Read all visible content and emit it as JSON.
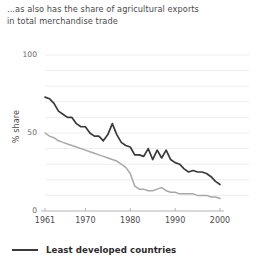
{
  "title": {
    "line1": "...as also has the share of agricultural exports",
    "line2": "in total merchandise trade"
  },
  "legend": {
    "entries": [
      {
        "label": "Least developed countries",
        "color": "#3a3a3a"
      }
    ]
  },
  "colors": {
    "series_dark": "#3a3a3a",
    "series_grey": "#a8a8a8",
    "axis": "#b4b4b4",
    "gridline": "#ededed",
    "text": "#4a4a4a"
  },
  "chart_data": {
    "type": "line",
    "title": "...as also has the share of agricultural exports in total merchandise trade",
    "xlabel": "",
    "ylabel": "% share",
    "xlim": [
      1961,
      2000
    ],
    "ylim": [
      0,
      100
    ],
    "grid": true,
    "legend_position": "bottom-left",
    "xticks": [
      1961,
      1970,
      1980,
      1990,
      2000
    ],
    "xtick_labels": [
      "1961",
      "1970",
      "1980",
      "1990",
      "2000"
    ],
    "yticks": [
      0,
      50,
      100
    ],
    "ytick_labels": [
      "0",
      "50",
      "100"
    ],
    "x": [
      1961,
      1962,
      1963,
      1964,
      1965,
      1966,
      1967,
      1968,
      1969,
      1970,
      1971,
      1972,
      1973,
      1974,
      1975,
      1976,
      1977,
      1978,
      1979,
      1980,
      1981,
      1982,
      1983,
      1984,
      1985,
      1986,
      1987,
      1988,
      1989,
      1990,
      1991,
      1992,
      1993,
      1994,
      1995,
      1996,
      1997,
      1998,
      1999,
      2000
    ],
    "series": [
      {
        "name": "Least developed countries",
        "color": "#3a3a3a",
        "values": [
          73,
          72,
          69,
          64,
          62,
          60,
          60,
          56,
          54,
          54,
          50,
          48,
          48,
          45,
          49,
          56,
          49,
          44,
          42,
          41,
          36,
          36,
          35,
          40,
          33,
          39,
          34,
          39,
          33,
          31,
          30,
          27,
          25,
          26,
          25,
          25,
          24,
          22,
          19,
          17
        ]
      },
      {
        "name": "",
        "color": "#a8a8a8",
        "values": [
          50,
          48,
          47,
          45,
          44,
          43,
          42,
          41,
          40,
          39,
          38,
          37,
          36,
          35,
          34,
          33,
          32,
          30,
          28,
          24,
          16,
          14,
          14,
          13,
          13,
          14,
          15,
          13,
          12,
          12,
          11,
          11,
          11,
          11,
          10,
          10,
          10,
          9,
          9,
          8
        ]
      }
    ]
  }
}
